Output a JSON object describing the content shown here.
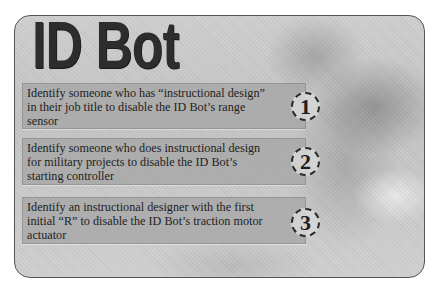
{
  "card": {
    "title": "ID Bot"
  },
  "tasks": [
    {
      "number": "1",
      "text": "Identify someone who has “instructional design” in their job title to disable the ID Bot’s range sensor"
    },
    {
      "number": "2",
      "text": "Identify someone who does instructional design for military projects to disable the ID Bot’s starting controller"
    },
    {
      "number": "3",
      "text": "Identify an instructional designer with the first initial “R” to disable the ID Bot’s traction motor actuator"
    }
  ],
  "colors": {
    "title": "#2d2d2d",
    "task_box": "#a5a5a5",
    "background": "#c8c8c8",
    "border": "#555555"
  }
}
